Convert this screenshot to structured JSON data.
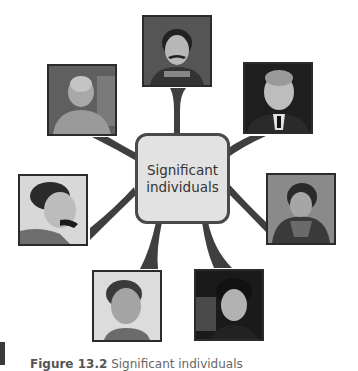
{
  "center": {
    "line1": "Significant",
    "line2": "individuals"
  },
  "photos": [
    {
      "id": "top",
      "label": "Portrait of a Japanese man in uniform with moustache",
      "tone": "#3d3d3d"
    },
    {
      "id": "top-left",
      "label": "Portrait of an elderly bald man smiling",
      "tone": "#6b6b6b"
    },
    {
      "id": "top-right",
      "label": "Portrait of a man in suit with glasses",
      "tone": "#2e2e2e"
    },
    {
      "id": "left",
      "label": "Profile portrait of a man with moustache",
      "tone": "#4a4a4a"
    },
    {
      "id": "right",
      "label": "Portrait of a woman with braided hair",
      "tone": "#5a5a5a"
    },
    {
      "id": "bottom-left",
      "label": "Portrait of a man in tunic",
      "tone": "#9a9a9a"
    },
    {
      "id": "bottom-right",
      "label": "Portrait of a woman with hair up",
      "tone": "#242424"
    }
  ],
  "caption": {
    "figure": "Figure 13.2",
    "text": "Significant individuals"
  },
  "colors": {
    "connector": "#3f3f3f",
    "box_fill": "#e2e2e2",
    "box_border": "#4a4a4a"
  }
}
